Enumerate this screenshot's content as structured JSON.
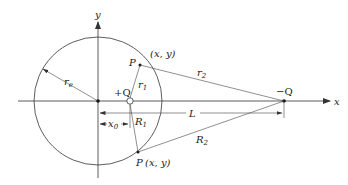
{
  "diagram": {
    "axes": {
      "x_label": "x",
      "y_label": "y"
    },
    "labels": {
      "r_e": "r",
      "r_e_sub": "e",
      "plus_q": "+Q",
      "minus_q": "−Q",
      "r1": "r",
      "r1_sub": "1",
      "r2": "r",
      "r2_sub": "2",
      "R1": "R",
      "R1_sub": "1",
      "R2": "R",
      "R2_sub": "2",
      "x0": "x",
      "x0_sub": "0",
      "L": "L",
      "P_upper": "P",
      "P_upper_coords": "(x, y)",
      "P_lower": "P",
      "P_lower_coords": "(x, y)"
    },
    "colors": {
      "line": "#333333",
      "background": "#ffffff"
    }
  }
}
